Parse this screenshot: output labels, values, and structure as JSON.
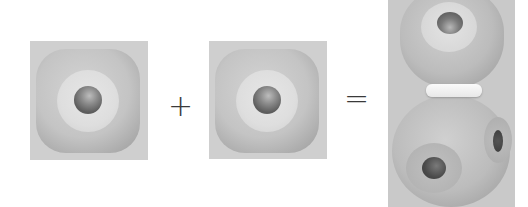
{
  "diagram": {
    "parts": [
      {
        "id": "piece-a",
        "label": "cube connector piece with central hole"
      },
      {
        "id": "piece-b",
        "label": "cube connector piece with central hole"
      }
    ],
    "operators": {
      "plus": "+",
      "equals": "="
    },
    "result": {
      "id": "assembled",
      "label": "two pieces joined with white spacer ring"
    }
  }
}
